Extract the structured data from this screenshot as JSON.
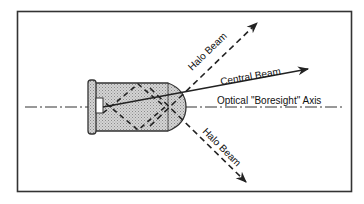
{
  "diagram": {
    "labels": {
      "halo_beam_upper": "Halo Beam",
      "central_beam": "Central Beam",
      "boresight_axis": "Optical \"Boresight\" Axis",
      "halo_beam_lower": "Halo Beam"
    },
    "colors": {
      "line": "#222222",
      "body_fill": "#bdbdbd",
      "background": "#ffffff"
    }
  }
}
